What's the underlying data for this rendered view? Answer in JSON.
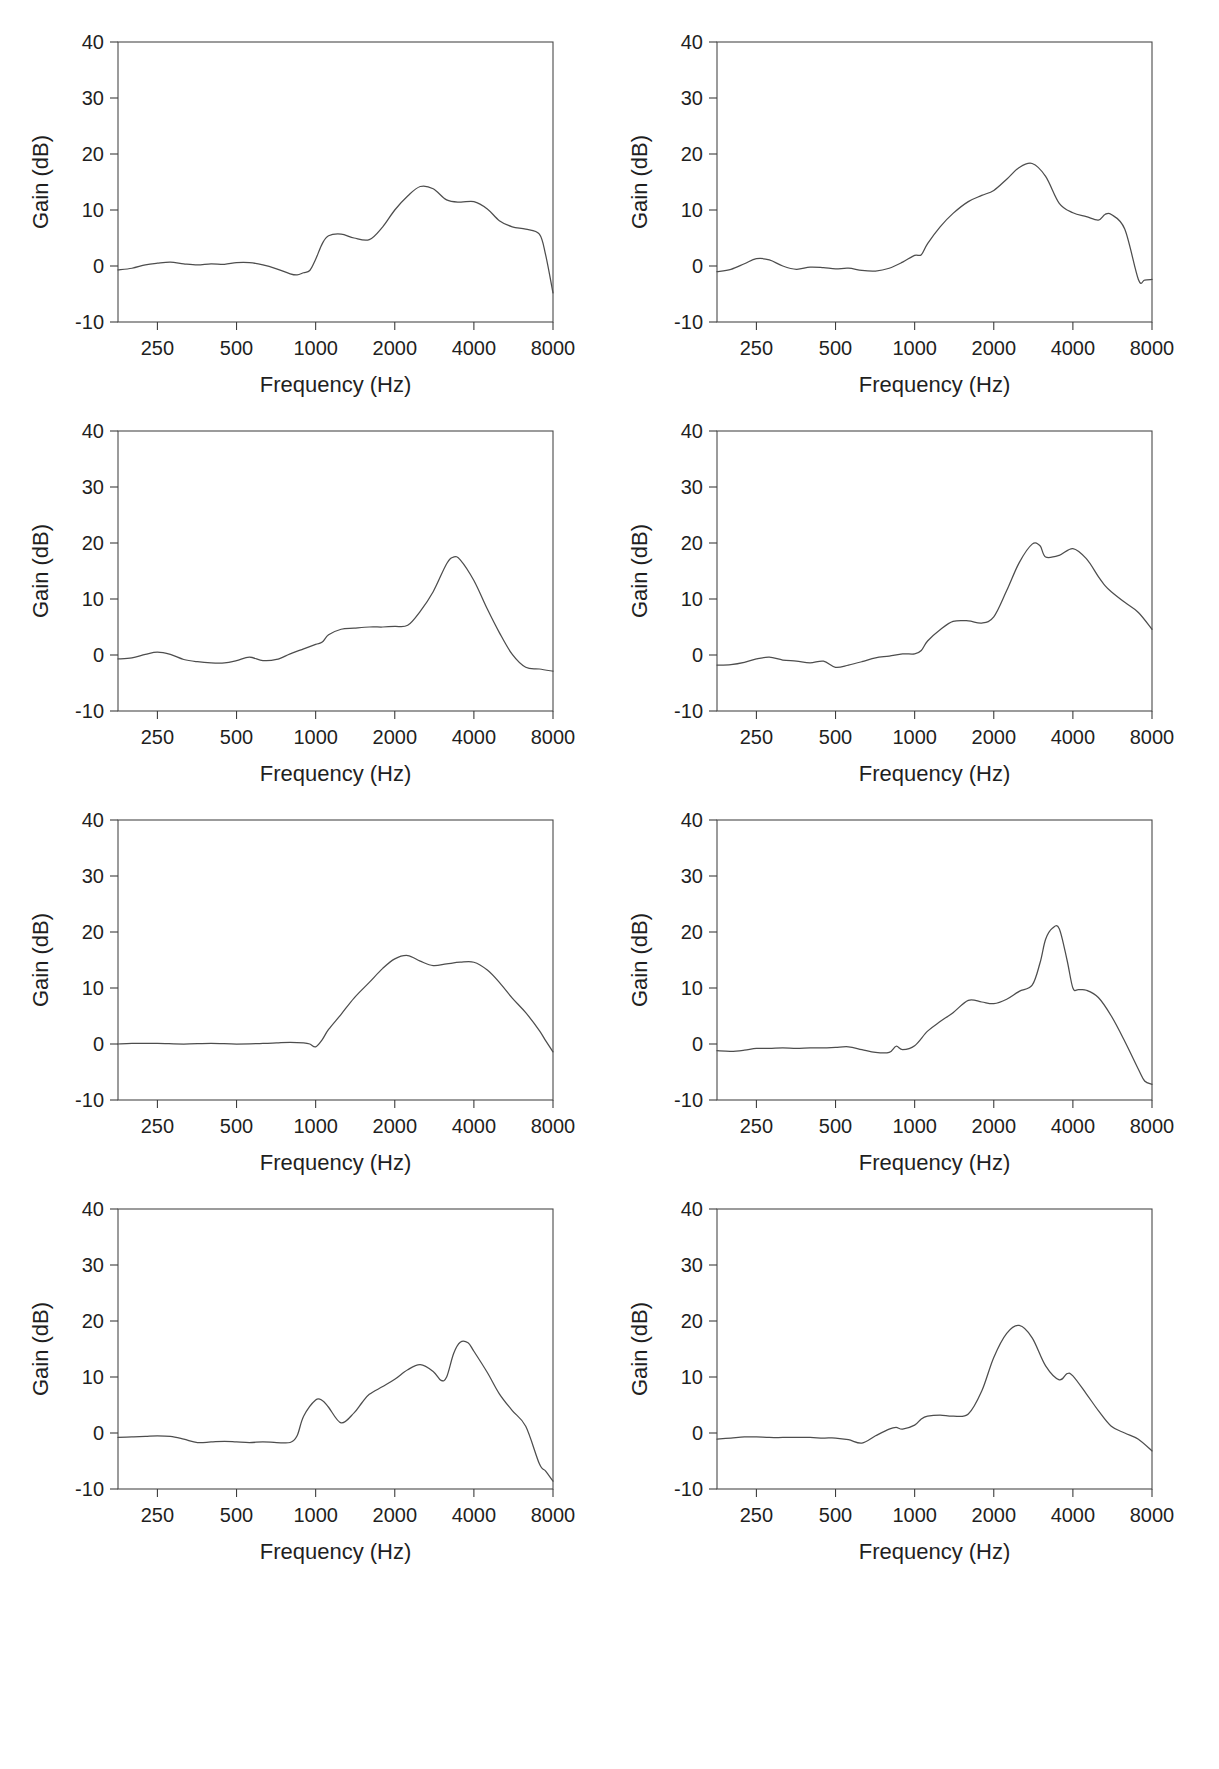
{
  "figure": {
    "type": "multi-panel-line-chart",
    "panel_count": 8,
    "rows": 4,
    "cols": 2,
    "background_color": "#ffffff",
    "line_color": "#4d4d4d",
    "axis_color": "#3d3d3d"
  },
  "axes": {
    "xlabel": "Frequency (Hz)",
    "ylabel": "Gain (dB)",
    "x_scale": "log",
    "x_tick_labels": [
      "250",
      "500",
      "1000",
      "2000",
      "4000",
      "8000"
    ],
    "x_tick_values": [
      250,
      500,
      1000,
      2000,
      4000,
      8000
    ],
    "xlim": [
      177,
      8000
    ],
    "y_tick_labels": [
      "-10",
      "0",
      "10",
      "20",
      "30",
      "40"
    ],
    "y_tick_values": [
      -10,
      0,
      10,
      20,
      30,
      40
    ],
    "ylim": [
      -10,
      40
    ],
    "grid": false,
    "legend": "none"
  },
  "chart_data": [
    {
      "type": "line",
      "panel": 1,
      "position": "row1-left",
      "title": "",
      "xlabel": "Frequency (Hz)",
      "ylabel": "Gain (dB)",
      "xlim": [
        177,
        8000
      ],
      "ylim": [
        -10,
        40
      ],
      "x_scale": "log",
      "x": [
        177,
        200,
        225,
        250,
        280,
        315,
        355,
        400,
        450,
        500,
        560,
        630,
        710,
        800,
        850,
        900,
        950,
        1000,
        1060,
        1120,
        1250,
        1400,
        1600,
        1800,
        2000,
        2240,
        2500,
        2800,
        3150,
        3550,
        4000,
        4500,
        5000,
        5600,
        6300,
        7100,
        7500,
        8000
      ],
      "y": [
        -0.7,
        -0.4,
        0.2,
        0.5,
        0.7,
        0.4,
        0.2,
        0.4,
        0.3,
        0.6,
        0.6,
        0.2,
        -0.5,
        -1.4,
        -1.6,
        -1.2,
        -0.8,
        1.2,
        4.0,
        5.4,
        5.7,
        5.0,
        4.7,
        7.0,
        10.0,
        12.5,
        14.2,
        13.8,
        11.8,
        11.4,
        11.5,
        10.2,
        8.1,
        7.0,
        6.6,
        5.7,
        2.0,
        -4.8
      ]
    },
    {
      "type": "line",
      "panel": 2,
      "position": "row1-right",
      "title": "",
      "xlabel": "Frequency (Hz)",
      "ylabel": "Gain (dB)",
      "xlim": [
        177,
        8000
      ],
      "ylim": [
        -10,
        40
      ],
      "x_scale": "log",
      "x": [
        177,
        200,
        225,
        250,
        280,
        315,
        355,
        400,
        450,
        500,
        560,
        630,
        710,
        800,
        900,
        1000,
        1060,
        1120,
        1250,
        1400,
        1600,
        1800,
        2000,
        2240,
        2500,
        2800,
        3150,
        3550,
        4000,
        4500,
        5000,
        5300,
        5600,
        6300,
        7100,
        7500,
        8000
      ],
      "y": [
        -1.0,
        -0.6,
        0.4,
        1.3,
        1.1,
        0.0,
        -0.6,
        -0.2,
        -0.3,
        -0.5,
        -0.4,
        -0.8,
        -0.9,
        -0.4,
        0.7,
        1.9,
        2.0,
        4.0,
        7.0,
        9.4,
        11.5,
        12.6,
        13.5,
        15.5,
        17.6,
        18.3,
        16.0,
        11.2,
        9.5,
        8.8,
        8.2,
        9.2,
        9.2,
        6.6,
        -2.4,
        -2.5,
        -2.4
      ]
    },
    {
      "type": "line",
      "panel": 3,
      "position": "row2-left",
      "title": "",
      "xlabel": "Frequency (Hz)",
      "ylabel": "Gain (dB)",
      "xlim": [
        177,
        8000
      ],
      "ylim": [
        -10,
        40
      ],
      "x_scale": "log",
      "x": [
        177,
        200,
        225,
        250,
        280,
        315,
        355,
        400,
        450,
        500,
        560,
        630,
        710,
        800,
        900,
        1000,
        1060,
        1120,
        1250,
        1400,
        1600,
        1800,
        2000,
        2240,
        2500,
        2800,
        3150,
        3350,
        3550,
        4000,
        4500,
        5000,
        5600,
        6300,
        7100,
        8000
      ],
      "y": [
        -0.7,
        -0.5,
        0.1,
        0.5,
        0.1,
        -0.8,
        -1.2,
        -1.4,
        -1.4,
        -1.0,
        -0.4,
        -1.0,
        -0.8,
        0.2,
        1.1,
        1.9,
        2.3,
        3.6,
        4.6,
        4.8,
        5.0,
        5.0,
        5.1,
        5.3,
        7.8,
        11.3,
        16.3,
        17.5,
        17.0,
        13.3,
        8.2,
        4.0,
        0.1,
        -2.2,
        -2.5,
        -2.9
      ]
    },
    {
      "type": "line",
      "panel": 4,
      "position": "row2-right",
      "title": "",
      "xlabel": "Frequency (Hz)",
      "ylabel": "Gain (dB)",
      "xlim": [
        177,
        8000
      ],
      "ylim": [
        -10,
        40
      ],
      "x_scale": "log",
      "x": [
        177,
        200,
        225,
        250,
        280,
        315,
        355,
        400,
        450,
        500,
        560,
        630,
        710,
        800,
        900,
        1000,
        1060,
        1120,
        1250,
        1400,
        1600,
        1800,
        2000,
        2240,
        2500,
        2800,
        3000,
        3150,
        3550,
        4000,
        4500,
        5000,
        5300,
        5600,
        6300,
        7100,
        8000
      ],
      "y": [
        -1.8,
        -1.7,
        -1.3,
        -0.7,
        -0.4,
        -0.9,
        -1.1,
        -1.4,
        -1.1,
        -2.2,
        -1.8,
        -1.2,
        -0.5,
        -0.2,
        0.2,
        0.2,
        0.8,
        2.5,
        4.5,
        6.0,
        6.1,
        5.7,
        6.8,
        11.5,
        16.5,
        19.8,
        19.5,
        17.5,
        17.8,
        19.0,
        17.2,
        14.0,
        12.4,
        11.3,
        9.4,
        7.6,
        4.6
      ]
    },
    {
      "type": "line",
      "panel": 5,
      "position": "row3-left",
      "title": "",
      "xlabel": "Frequency (Hz)",
      "ylabel": "Gain (dB)",
      "xlim": [
        177,
        8000
      ],
      "ylim": [
        -10,
        40
      ],
      "x_scale": "log",
      "x": [
        177,
        200,
        250,
        315,
        400,
        500,
        630,
        710,
        800,
        900,
        950,
        1000,
        1060,
        1120,
        1250,
        1400,
        1600,
        1800,
        2000,
        2240,
        2500,
        2800,
        3150,
        3550,
        4000,
        4500,
        5000,
        5600,
        6300,
        7100,
        7500,
        8000
      ],
      "y": [
        0.0,
        0.1,
        0.1,
        0.0,
        0.1,
        0.0,
        0.1,
        0.2,
        0.3,
        0.2,
        0.0,
        -0.5,
        0.8,
        2.6,
        5.3,
        8.2,
        11.0,
        13.5,
        15.2,
        15.8,
        14.8,
        14.0,
        14.3,
        14.6,
        14.6,
        13.2,
        11.0,
        8.2,
        5.6,
        2.4,
        0.6,
        -1.4
      ]
    },
    {
      "type": "line",
      "panel": 6,
      "position": "row3-right",
      "title": "",
      "xlabel": "Frequency (Hz)",
      "ylabel": "Gain (dB)",
      "xlim": [
        177,
        8000
      ],
      "ylim": [
        -10,
        40
      ],
      "x_scale": "log",
      "x": [
        177,
        200,
        225,
        250,
        280,
        315,
        355,
        400,
        450,
        500,
        560,
        630,
        710,
        800,
        850,
        900,
        1000,
        1120,
        1250,
        1400,
        1600,
        1800,
        2000,
        2240,
        2500,
        2800,
        3000,
        3150,
        3350,
        3550,
        3800,
        4000,
        4200,
        4500,
        5000,
        5600,
        6300,
        7100,
        7500,
        8000
      ],
      "y": [
        -1.2,
        -1.3,
        -1.1,
        -0.8,
        -0.8,
        -0.7,
        -0.8,
        -0.7,
        -0.7,
        -0.6,
        -0.5,
        -1.0,
        -1.5,
        -1.5,
        -0.4,
        -1.0,
        -0.3,
        2.3,
        4.0,
        5.6,
        7.8,
        7.5,
        7.2,
        8.0,
        9.4,
        10.5,
        14.5,
        18.7,
        20.7,
        20.6,
        15.0,
        10.0,
        9.7,
        9.6,
        8.3,
        5.0,
        0.5,
        -4.5,
        -6.6,
        -7.2
      ]
    },
    {
      "type": "line",
      "panel": 7,
      "position": "row4-left",
      "title": "",
      "xlabel": "Frequency (Hz)",
      "ylabel": "Gain (dB)",
      "xlim": [
        177,
        8000
      ],
      "ylim": [
        -10,
        40
      ],
      "x_scale": "log",
      "x": [
        177,
        200,
        225,
        250,
        280,
        315,
        355,
        400,
        450,
        500,
        560,
        630,
        710,
        800,
        850,
        900,
        1000,
        1060,
        1120,
        1250,
        1400,
        1500,
        1600,
        1800,
        2000,
        2240,
        2500,
        2800,
        3000,
        3150,
        3350,
        3550,
        3800,
        4000,
        4500,
        5000,
        5600,
        6300,
        7100,
        7500,
        8000
      ],
      "y": [
        -0.8,
        -0.7,
        -0.6,
        -0.5,
        -0.6,
        -1.1,
        -1.7,
        -1.6,
        -1.5,
        -1.6,
        -1.7,
        -1.6,
        -1.7,
        -1.7,
        -0.5,
        3.0,
        5.9,
        5.8,
        4.6,
        1.8,
        3.6,
        5.4,
        6.9,
        8.3,
        9.6,
        11.3,
        12.2,
        11.0,
        9.4,
        10.0,
        14.2,
        16.2,
        16.1,
        14.6,
        10.8,
        7.0,
        4.0,
        1.2,
        -5.5,
        -6.8,
        -8.6
      ]
    },
    {
      "type": "line",
      "panel": 8,
      "position": "row4-right",
      "title": "",
      "xlabel": "Frequency (Hz)",
      "ylabel": "Gain (dB)",
      "xlim": [
        177,
        8000
      ],
      "ylim": [
        -10,
        40
      ],
      "x_scale": "log",
      "x": [
        177,
        200,
        225,
        250,
        280,
        315,
        355,
        400,
        450,
        500,
        560,
        630,
        710,
        800,
        850,
        900,
        1000,
        1060,
        1120,
        1250,
        1400,
        1600,
        1800,
        2000,
        2240,
        2500,
        2800,
        3150,
        3550,
        3800,
        4000,
        4500,
        5000,
        5600,
        6300,
        7100,
        8000
      ],
      "y": [
        -1.1,
        -0.9,
        -0.7,
        -0.7,
        -0.8,
        -0.8,
        -0.8,
        -0.8,
        -0.9,
        -0.9,
        -1.2,
        -1.8,
        -0.5,
        0.7,
        1.0,
        0.7,
        1.4,
        2.5,
        3.0,
        3.2,
        3.0,
        3.4,
        7.5,
        13.5,
        17.8,
        19.2,
        17.0,
        12.0,
        9.5,
        10.6,
        10.2,
        7.0,
        4.0,
        1.2,
        0.0,
        -1.1,
        -3.2
      ]
    }
  ]
}
